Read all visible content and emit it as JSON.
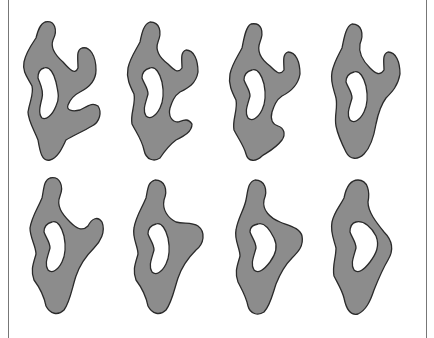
{
  "figure": {
    "fill_color": "#8c8c8c",
    "outline_color": "#2a2a2a",
    "background": "#ffffff",
    "shapes": [
      {
        "index": 1,
        "row": 1,
        "col": 1
      },
      {
        "index": 2,
        "row": 1,
        "col": 2
      },
      {
        "index": 3,
        "row": 1,
        "col": 3
      },
      {
        "index": 4,
        "row": 1,
        "col": 4
      },
      {
        "index": 5,
        "row": 2,
        "col": 1
      },
      {
        "index": 6,
        "row": 2,
        "col": 2
      },
      {
        "index": 7,
        "row": 2,
        "col": 3
      },
      {
        "index": 8,
        "row": 2,
        "col": 4
      }
    ]
  }
}
